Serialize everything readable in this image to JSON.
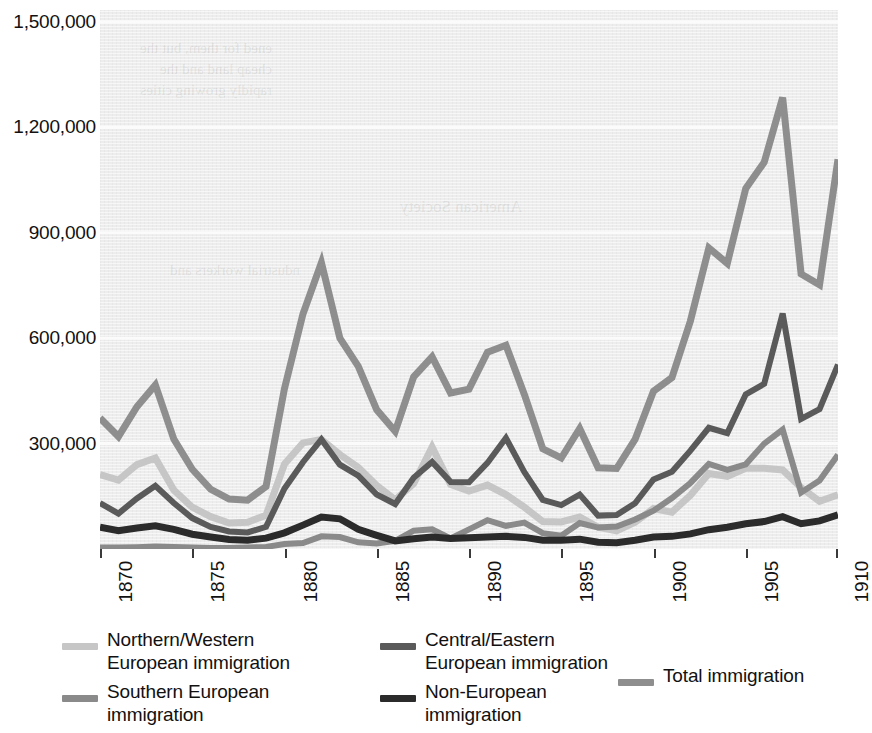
{
  "chart_data": {
    "type": "line",
    "title": "",
    "subtitle": "",
    "xlabel": "",
    "ylabel": "",
    "xlim": [
      1870,
      1910
    ],
    "ylim": [
      0,
      1500000
    ],
    "grid": true,
    "grid_axis": "y",
    "legend_position": "below",
    "y_ticks": [
      "1,500,000",
      "1,200,000",
      "900,000",
      "600,000",
      "300,000"
    ],
    "y_tick_values": [
      1500000,
      1200000,
      900000,
      600000,
      300000
    ],
    "x_ticks": [
      "1870",
      "1875",
      "1880",
      "1885",
      "1890",
      "1895",
      "1900",
      "1905",
      "1910"
    ],
    "x_tick_values": [
      1870,
      1875,
      1880,
      1885,
      1890,
      1895,
      1900,
      1905,
      1910
    ],
    "x": [
      1870,
      1871,
      1872,
      1873,
      1874,
      1875,
      1876,
      1877,
      1878,
      1879,
      1880,
      1881,
      1882,
      1883,
      1884,
      1885,
      1886,
      1887,
      1888,
      1889,
      1890,
      1891,
      1892,
      1893,
      1894,
      1895,
      1896,
      1897,
      1898,
      1899,
      1900,
      1901,
      1902,
      1903,
      1904,
      1905,
      1906,
      1907,
      1908,
      1909,
      1910
    ],
    "series": [
      {
        "name": "Total immigration",
        "color": "#8e8e8e",
        "width": 7,
        "values": [
          373000,
          320000,
          405000,
          467000,
          313000,
          227000,
          170000,
          142000,
          139000,
          178000,
          457000,
          669000,
          815000,
          600000,
          520000,
          396000,
          335000,
          490000,
          547000,
          444000,
          455000,
          560000,
          580000,
          440000,
          285000,
          259000,
          343000,
          231000,
          229000,
          312000,
          449000,
          488000,
          649000,
          857000,
          813000,
          1026000,
          1101000,
          1285000,
          783000,
          752000,
          1109000
        ]
      },
      {
        "name": "Central/Eastern European immigration",
        "color": "#5a5a5a",
        "width": 6,
        "values": [
          131000,
          101000,
          144000,
          180000,
          131000,
          88000,
          63000,
          50000,
          47000,
          63000,
          172000,
          247000,
          312000,
          240000,
          209000,
          155000,
          128000,
          203000,
          248000,
          191000,
          190000,
          245000,
          316000,
          219000,
          140000,
          125000,
          155000,
          95000,
          97000,
          130000,
          198000,
          220000,
          280000,
          345000,
          330000,
          440000,
          470000,
          670000,
          370000,
          398000,
          525000
        ]
      },
      {
        "name": "Southern European immigration",
        "color": "#8a8a8a",
        "width": 6,
        "values": [
          4000,
          4000,
          5000,
          7000,
          6000,
          4000,
          3000,
          3000,
          4000,
          6000,
          14000,
          17000,
          36000,
          34000,
          19000,
          16000,
          23000,
          52000,
          56000,
          30000,
          56000,
          82000,
          66000,
          75000,
          45000,
          38000,
          74000,
          61000,
          64000,
          84000,
          109000,
          145000,
          188000,
          242000,
          225000,
          241000,
          300000,
          340000,
          161000,
          195000,
          268000
        ]
      },
      {
        "name": "Northern/Western European immigration",
        "color": "#c6c6c6",
        "width": 7,
        "values": [
          212000,
          196000,
          240000,
          259000,
          168000,
          119000,
          92000,
          74000,
          76000,
          96000,
          242000,
          302000,
          312000,
          269000,
          232000,
          181000,
          140000,
          186000,
          290000,
          184000,
          165000,
          182000,
          155000,
          119000,
          78000,
          77000,
          91000,
          62000,
          52000,
          76000,
          115000,
          105000,
          153000,
          215000,
          207000,
          230000,
          230000,
          225000,
          175000,
          136000,
          154000
        ]
      },
      {
        "name": "Non-European immigration",
        "color": "#2b2b2b",
        "width": 7,
        "values": [
          62000,
          52000,
          60000,
          66000,
          56000,
          42000,
          34000,
          27000,
          25000,
          31000,
          46000,
          68000,
          91000,
          86000,
          56000,
          39000,
          23000,
          29000,
          34000,
          30000,
          32000,
          34000,
          36000,
          33000,
          25000,
          25000,
          28000,
          19000,
          18000,
          25000,
          34000,
          36000,
          43000,
          55000,
          62000,
          72000,
          78000,
          92000,
          72000,
          80000,
          97000
        ]
      }
    ]
  },
  "legend": {
    "items": [
      {
        "id": "northern-western",
        "label": "Northern/Western\nEuropean immigration",
        "color": "#c6c6c6"
      },
      {
        "id": "central-eastern",
        "label": "Central/Eastern\nEuropean immigration",
        "color": "#5a5a5a"
      },
      {
        "id": "southern",
        "label": "Southern European\nimmigration",
        "color": "#8a8a8a"
      },
      {
        "id": "non-european",
        "label": "Non-European\nimmigration",
        "color": "#2b2b2b"
      },
      {
        "id": "total",
        "label": "Total immigration",
        "color": "#8e8e8e"
      }
    ]
  },
  "ghost_text": {
    "block_1": "ened for them, but the\ncheap land and the\nrapidly growing cities",
    "block_2": "American Society",
    "block_3": "ndustrial workers and"
  }
}
